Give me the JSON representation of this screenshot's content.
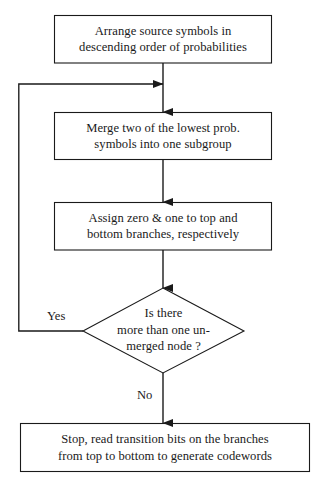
{
  "diagram": {
    "type": "flowchart",
    "stroke_color": "#1a1a1a",
    "fill_color": "#ffffff",
    "nodes": [
      {
        "id": "arrange",
        "shape": "process",
        "lines": [
          "Arrange source symbols in",
          "descending order of probabilities"
        ]
      },
      {
        "id": "merge",
        "shape": "process",
        "lines": [
          "Merge two of the lowest prob.",
          "symbols into one subgroup"
        ]
      },
      {
        "id": "assign",
        "shape": "process",
        "lines": [
          "Assign zero & one to top and",
          "bottom branches, respectively"
        ]
      },
      {
        "id": "decision",
        "shape": "decision",
        "lines": [
          "Is there",
          "more than one un-",
          "merged node ?"
        ]
      },
      {
        "id": "stop",
        "shape": "process",
        "lines": [
          "Stop, read transition bits on the branches",
          "from top to bottom to generate codewords"
        ]
      }
    ],
    "edge_labels": {
      "yes": "Yes",
      "no": "No"
    }
  }
}
